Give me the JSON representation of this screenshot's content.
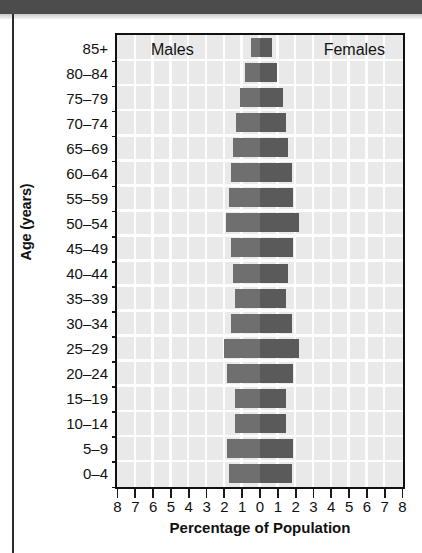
{
  "chart_data": {
    "type": "bar",
    "subtype": "population-pyramid",
    "title": "",
    "xlabel": "Percentage of Population",
    "ylabel": "Age (years)",
    "xlim": [
      -8,
      8
    ],
    "xticks": [
      8,
      7,
      6,
      5,
      4,
      3,
      2,
      1,
      0,
      1,
      2,
      3,
      4,
      5,
      6,
      7,
      8
    ],
    "grid": true,
    "legend_position": "inside-top",
    "categories": [
      "85+",
      "80–84",
      "75–79",
      "70–74",
      "65–69",
      "60–64",
      "55–59",
      "50–54",
      "45–49",
      "40–44",
      "35–39",
      "30–34",
      "25–29",
      "20–24",
      "15–19",
      "10–14",
      "5–9",
      "0–4"
    ],
    "series": [
      {
        "name": "Males",
        "color": "#6f6f6f",
        "side": "left",
        "values": [
          0.5,
          0.8,
          1.1,
          1.3,
          1.5,
          1.6,
          1.7,
          1.9,
          1.6,
          1.5,
          1.4,
          1.6,
          2.0,
          1.8,
          1.4,
          1.4,
          1.8,
          1.7
        ]
      },
      {
        "name": "Females",
        "color": "#5a5a5a",
        "side": "right",
        "values": [
          0.7,
          1.0,
          1.3,
          1.5,
          1.6,
          1.8,
          1.9,
          2.2,
          1.9,
          1.6,
          1.5,
          1.8,
          2.2,
          1.9,
          1.5,
          1.5,
          1.9,
          1.8
        ]
      }
    ]
  },
  "legend": {
    "males": "Males",
    "females": "Females"
  },
  "axes": {
    "x_title": "Percentage of Population",
    "y_title": "Age (years)"
  }
}
